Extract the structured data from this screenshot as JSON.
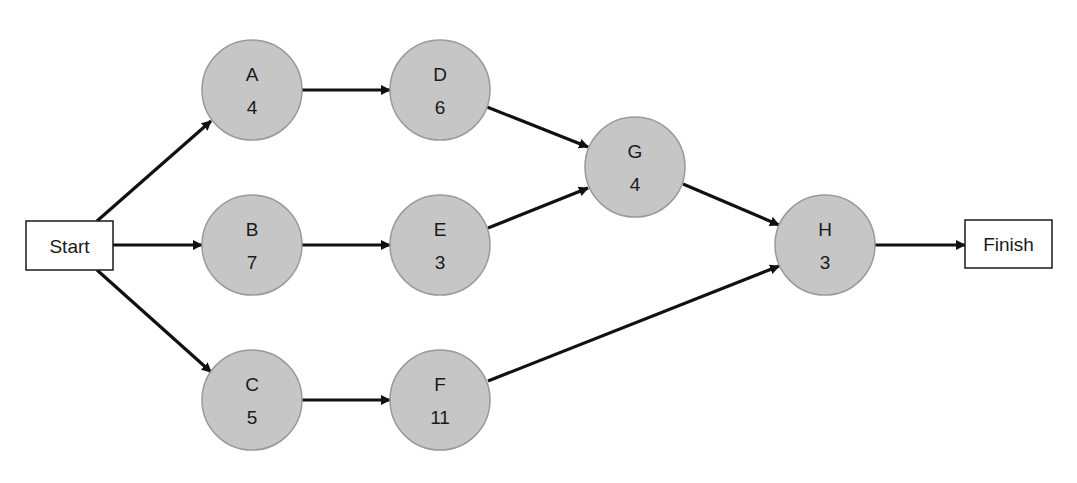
{
  "diagram": {
    "type": "activity-on-node network",
    "colors": {
      "node_fill": "#c6c6c6",
      "node_stroke": "#9a9a9a",
      "edge": "#111111",
      "box_fill": "#ffffff",
      "box_stroke": "#1a1a1a"
    },
    "start": {
      "label": "Start",
      "x": 26,
      "y": 221,
      "w": 87,
      "h": 49
    },
    "finish": {
      "label": "Finish",
      "x": 965,
      "y": 220,
      "w": 87,
      "h": 48
    },
    "nodes": [
      {
        "id": "A",
        "label": "A",
        "duration": "4",
        "cx": 252,
        "cy": 90,
        "r": 50
      },
      {
        "id": "B",
        "label": "B",
        "duration": "7",
        "cx": 252,
        "cy": 245,
        "r": 50
      },
      {
        "id": "C",
        "label": "C",
        "duration": "5",
        "cx": 252,
        "cy": 400,
        "r": 50
      },
      {
        "id": "D",
        "label": "D",
        "duration": "6",
        "cx": 440,
        "cy": 90,
        "r": 50
      },
      {
        "id": "E",
        "label": "E",
        "duration": "3",
        "cx": 440,
        "cy": 245,
        "r": 50
      },
      {
        "id": "F",
        "label": "F",
        "duration": "11",
        "cx": 440,
        "cy": 400,
        "r": 50
      },
      {
        "id": "G",
        "label": "G",
        "duration": "4",
        "cx": 635,
        "cy": 167,
        "r": 50
      },
      {
        "id": "H",
        "label": "H",
        "duration": "3",
        "cx": 825,
        "cy": 245,
        "r": 50
      }
    ],
    "edges": [
      {
        "from": "Start",
        "to": "A",
        "x1": 97,
        "y1": 221,
        "x2": 211,
        "y2": 121
      },
      {
        "from": "Start",
        "to": "B",
        "x1": 113,
        "y1": 245,
        "x2": 202,
        "y2": 245
      },
      {
        "from": "Start",
        "to": "C",
        "x1": 97,
        "y1": 270,
        "x2": 211,
        "y2": 372
      },
      {
        "from": "A",
        "to": "D",
        "x1": 302,
        "y1": 90,
        "x2": 390,
        "y2": 90
      },
      {
        "from": "B",
        "to": "E",
        "x1": 302,
        "y1": 245,
        "x2": 390,
        "y2": 245
      },
      {
        "from": "C",
        "to": "F",
        "x1": 302,
        "y1": 400,
        "x2": 390,
        "y2": 400
      },
      {
        "from": "D",
        "to": "G",
        "x1": 487,
        "y1": 107,
        "x2": 588,
        "y2": 147
      },
      {
        "from": "E",
        "to": "G",
        "x1": 488,
        "y1": 228,
        "x2": 588,
        "y2": 188
      },
      {
        "from": "G",
        "to": "H",
        "x1": 683,
        "y1": 184,
        "x2": 779,
        "y2": 225
      },
      {
        "from": "F",
        "to": "H",
        "x1": 488,
        "y1": 381,
        "x2": 779,
        "y2": 266
      },
      {
        "from": "H",
        "to": "Finish",
        "x1": 875,
        "y1": 245,
        "x2": 965,
        "y2": 245
      }
    ]
  }
}
